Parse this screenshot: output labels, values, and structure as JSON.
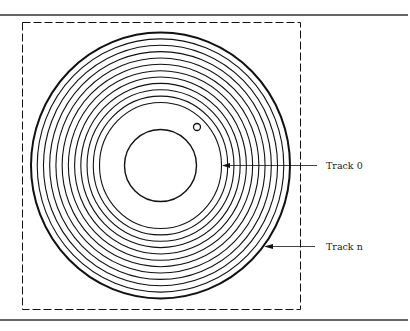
{
  "figure": {
    "colors": {
      "stroke": "#111111",
      "background": "#ffffff",
      "rule": "#333333"
    },
    "disk": {
      "center": [
        160.5,
        165.5
      ],
      "outer_radius_x": 129.5,
      "outer_radius_y": 133,
      "track_count": 12,
      "innermost_radius_x": 61,
      "innermost_radius_y": 63,
      "hub_radius": 36,
      "index_hole": {
        "cx": 197,
        "cy": 127,
        "r": 3.5
      }
    },
    "labels": {
      "track_0": "Track 0",
      "track_n": "Track n"
    }
  }
}
